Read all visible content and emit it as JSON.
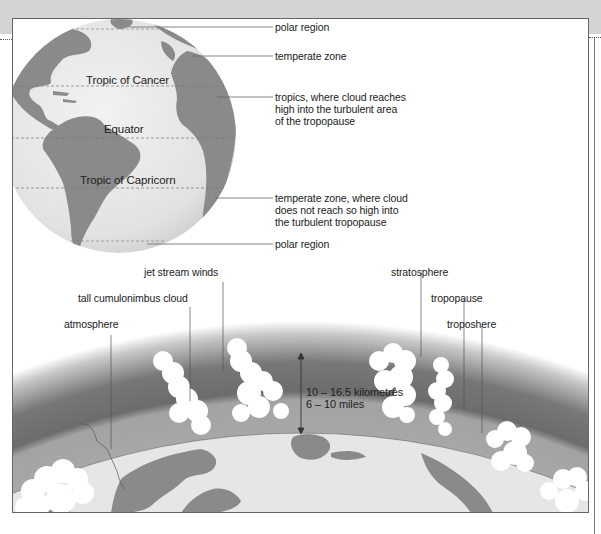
{
  "globe": {
    "latitude_lines": {
      "tropic_of_cancer": "Tropic of Cancer",
      "equator": "Equator",
      "tropic_of_capricorn": "Tropic of Capricorn"
    },
    "callouts": [
      {
        "id": "polar-north",
        "text": "polar region"
      },
      {
        "id": "temperate-north",
        "text": "temperate zone"
      },
      {
        "id": "tropics",
        "text": "tropics, where cloud reaches\nhigh into the turbulent area\nof the tropopause"
      },
      {
        "id": "temperate-south",
        "text": "temperate zone, where cloud\ndoes not reach so high into\nthe turbulent tropopause"
      },
      {
        "id": "polar-south",
        "text": "polar region"
      }
    ]
  },
  "atmosphere_cross_section": {
    "labels": {
      "jet_stream": "jet stream winds",
      "cumulonimbus": "tall cumulonimbus cloud",
      "atmosphere": "atmosphere",
      "stratosphere": "stratosphere",
      "tropopause": "tropopause",
      "troposphere": "troposhere"
    },
    "height_measure": {
      "km": "10 – 16.5 kilometres",
      "miles": "6 – 10 miles"
    }
  },
  "colors": {
    "band": "#d4d4d4",
    "ocean": "#e6e6e6",
    "land": "#8a8a8a",
    "stratosphere_dark": "#6e6e6e",
    "troposphere_mid": "#a6a6a6",
    "cloud": "#ffffff"
  }
}
